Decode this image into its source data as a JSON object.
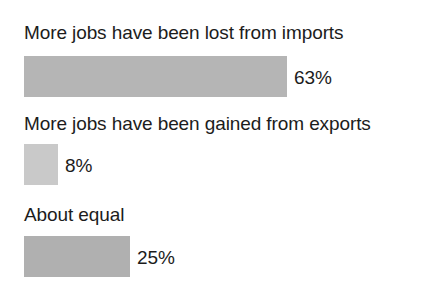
{
  "chart_data": {
    "type": "bar",
    "orientation": "horizontal",
    "title": "",
    "xlabel": "",
    "ylabel": "",
    "categories": [
      "More jobs have been lost from imports",
      "More jobs have been gained from exports",
      "About equal"
    ],
    "values": [
      63,
      8,
      25
    ],
    "value_labels": [
      "63%",
      "8%",
      "25%"
    ],
    "unit": "%",
    "xlim": [
      0,
      100
    ],
    "grid": false,
    "legend": false,
    "bar_colors": [
      "#b5b5b5",
      "#c9c9c9",
      "#b0b0b0"
    ],
    "text_color": "#1c1c1c",
    "background_color": "#ffffff"
  },
  "chart": {
    "bars": [
      {
        "label": "More jobs have been lost from imports",
        "value_label": "63%",
        "value": 63,
        "color": "#b5b5b5",
        "width_px": 263
      },
      {
        "label": "More jobs have been gained from exports",
        "value_label": "8%",
        "value": 8,
        "color": "#c9c9c9",
        "width_px": 34
      },
      {
        "label": "About equal",
        "value_label": "25%",
        "value": 25,
        "color": "#b0b0b0",
        "width_px": 106
      }
    ]
  }
}
